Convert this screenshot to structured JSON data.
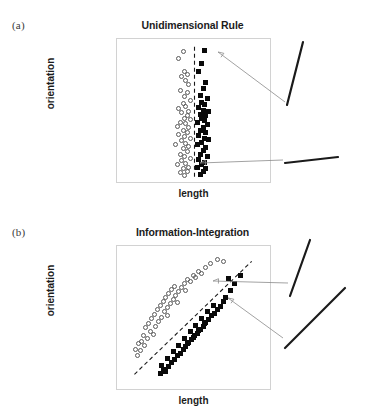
{
  "figure": {
    "background": "#ffffff",
    "open_marker_color": "#5a5a5a",
    "filled_marker_color": "#0a0a0a",
    "frame_color": "#d2d2d2",
    "bound_color": "#1a1a1a",
    "arrow_color": "#8a8a8a",
    "stimulus_color": "#1a1a1a"
  },
  "panels": [
    {
      "key": "a",
      "label": "(a)",
      "title": "Unidimensional Rule",
      "xlabel": "length",
      "ylabel": "orientation",
      "stimuli": [
        {
          "name": "steep-line-stimulus",
          "x1": 303,
          "y1": 42,
          "x2": 287,
          "y2": 105
        },
        {
          "name": "shallow-line-stimulus",
          "x1": 285,
          "y1": 163,
          "x2": 338,
          "y2": 157
        }
      ],
      "arrows": [
        {
          "name": "arrow-to-steep-stimulus",
          "x1": 285,
          "y1": 102,
          "x2": 218,
          "y2": 52
        },
        {
          "name": "arrow-to-shallow-stimulus",
          "x1": 283,
          "y1": 160,
          "x2": 200,
          "y2": 163
        }
      ]
    },
    {
      "key": "b",
      "label": "(b)",
      "title": "Information-Integration",
      "xlabel": "length",
      "ylabel": "orientation",
      "stimuli": [
        {
          "name": "steep-line-stimulus",
          "x1": 310,
          "y1": 240,
          "x2": 290,
          "y2": 296
        },
        {
          "name": "diagonal-line-stimulus",
          "x1": 285,
          "y1": 348,
          "x2": 345,
          "y2": 288
        }
      ],
      "arrows": [
        {
          "name": "arrow-to-steep-stimulus",
          "x1": 288,
          "y1": 283,
          "x2": 213,
          "y2": 281
        },
        {
          "name": "arrow-to-diagonal-stimulus",
          "x1": 283,
          "y1": 338,
          "x2": 228,
          "y2": 298
        }
      ]
    }
  ],
  "chart_data": [
    {
      "type": "scatter",
      "panel": "a",
      "title": "Unidimensional Rule",
      "xlabel": "length",
      "ylabel": "orientation",
      "xlim": [
        0,
        100
      ],
      "ylim": [
        0,
        100
      ],
      "grid": false,
      "legend": null,
      "axis_ticks": false,
      "decision_bound": {
        "name": "vertical-decision-bound",
        "style": "dashed",
        "type": "vertical",
        "x": 50,
        "y_from": 1,
        "y_to": 99
      },
      "series": [
        {
          "name": "Category A",
          "marker": "open-circle",
          "color": "#5a5a5a",
          "points": [
            [
              42,
              95
            ],
            [
              39,
              90
            ],
            [
              43,
              80
            ],
            [
              45,
              78
            ],
            [
              41,
              76
            ],
            [
              44,
              73
            ],
            [
              46,
              70
            ],
            [
              40,
              66
            ],
            [
              45,
              64
            ],
            [
              43,
              61
            ],
            [
              47,
              58
            ],
            [
              42,
              56
            ],
            [
              44,
              54
            ],
            [
              39,
              52
            ],
            [
              46,
              50
            ],
            [
              41,
              49
            ],
            [
              45,
              47
            ],
            [
              43,
              45
            ],
            [
              47,
              44
            ],
            [
              40,
              42
            ],
            [
              44,
              41
            ],
            [
              38,
              39
            ],
            [
              46,
              38
            ],
            [
              42,
              36
            ],
            [
              45,
              34
            ],
            [
              39,
              33
            ],
            [
              43,
              31
            ],
            [
              47,
              30
            ],
            [
              41,
              28
            ],
            [
              44,
              26
            ],
            [
              37,
              25
            ],
            [
              46,
              24
            ],
            [
              42,
              22
            ],
            [
              45,
              20
            ],
            [
              40,
              18
            ],
            [
              43,
              16
            ],
            [
              47,
              15
            ],
            [
              41,
              13
            ],
            [
              44,
              11
            ],
            [
              38,
              10
            ],
            [
              46,
              8
            ],
            [
              42,
              7
            ],
            [
              45,
              5
            ],
            [
              40,
              4
            ],
            [
              43,
              2
            ]
          ]
        },
        {
          "name": "Category B",
          "marker": "filled-square",
          "color": "#0a0a0a",
          "points": [
            [
              57,
              96
            ],
            [
              55,
              86
            ],
            [
              53,
              80
            ],
            [
              58,
              72
            ],
            [
              56,
              67
            ],
            [
              54,
              62
            ],
            [
              59,
              60
            ],
            [
              55,
              57
            ],
            [
              57,
              55
            ],
            [
              53,
              53
            ],
            [
              56,
              51
            ],
            [
              60,
              50
            ],
            [
              54,
              48
            ],
            [
              58,
              47
            ],
            [
              55,
              45
            ],
            [
              57,
              43
            ],
            [
              52,
              42
            ],
            [
              59,
              40
            ],
            [
              56,
              38
            ],
            [
              54,
              36
            ],
            [
              58,
              34
            ],
            [
              53,
              32
            ],
            [
              57,
              30
            ],
            [
              60,
              29
            ],
            [
              55,
              27
            ],
            [
              52,
              25
            ],
            [
              58,
              23
            ],
            [
              56,
              21
            ],
            [
              54,
              18
            ],
            [
              59,
              16
            ],
            [
              53,
              14
            ],
            [
              57,
              12
            ],
            [
              55,
              10
            ],
            [
              52,
              8
            ],
            [
              58,
              7
            ],
            [
              56,
              5
            ],
            [
              54,
              3
            ]
          ]
        }
      ]
    },
    {
      "type": "scatter",
      "panel": "b",
      "title": "Information-Integration",
      "xlabel": "length",
      "ylabel": "orientation",
      "xlim": [
        0,
        100
      ],
      "ylim": [
        0,
        100
      ],
      "grid": false,
      "legend": null,
      "axis_ticks": false,
      "decision_bound": {
        "name": "diagonal-decision-bound",
        "style": "dashed",
        "type": "diagonal",
        "x_from": 8,
        "y_from": 8,
        "x_to": 90,
        "y_to": 93
      },
      "series": [
        {
          "name": "Category A",
          "marker": "open-circle",
          "color": "#5a5a5a",
          "points": [
            [
              9,
              27
            ],
            [
              11,
              31
            ],
            [
              10,
              22
            ],
            [
              13,
              33
            ],
            [
              15,
              30
            ],
            [
              14,
              37
            ],
            [
              17,
              35
            ],
            [
              12,
              26
            ],
            [
              19,
              40
            ],
            [
              16,
              43
            ],
            [
              21,
              38
            ],
            [
              18,
              46
            ],
            [
              23,
              44
            ],
            [
              20,
              50
            ],
            [
              25,
              48
            ],
            [
              22,
              53
            ],
            [
              27,
              51
            ],
            [
              24,
              57
            ],
            [
              29,
              55
            ],
            [
              26,
              60
            ],
            [
              31,
              58
            ],
            [
              28,
              63
            ],
            [
              33,
              61
            ],
            [
              30,
              66
            ],
            [
              35,
              64
            ],
            [
              32,
              69
            ],
            [
              37,
              67
            ],
            [
              34,
              72
            ],
            [
              39,
              70
            ],
            [
              36,
              74
            ],
            [
              41,
              73
            ],
            [
              43,
              76
            ],
            [
              45,
              79
            ],
            [
              47,
              78
            ],
            [
              49,
              82
            ],
            [
              51,
              81
            ],
            [
              53,
              85
            ],
            [
              55,
              84
            ],
            [
              58,
              88
            ],
            [
              61,
              91
            ],
            [
              66,
              94
            ],
            [
              70,
              93
            ],
            [
              44,
              71
            ],
            [
              38,
              62
            ],
            [
              31,
              52
            ]
          ]
        },
        {
          "name": "Category B",
          "marker": "filled-square",
          "color": "#0a0a0a",
          "points": [
            [
              26,
              9
            ],
            [
              28,
              12
            ],
            [
              30,
              10
            ],
            [
              27,
              15
            ],
            [
              32,
              14
            ],
            [
              34,
              17
            ],
            [
              31,
              20
            ],
            [
              36,
              19
            ],
            [
              38,
              22
            ],
            [
              35,
              25
            ],
            [
              40,
              24
            ],
            [
              42,
              27
            ],
            [
              39,
              30
            ],
            [
              44,
              29
            ],
            [
              46,
              32
            ],
            [
              43,
              35
            ],
            [
              48,
              34
            ],
            [
              50,
              37
            ],
            [
              47,
              40
            ],
            [
              52,
              39
            ],
            [
              54,
              42
            ],
            [
              51,
              45
            ],
            [
              56,
              44
            ],
            [
              58,
              47
            ],
            [
              55,
              50
            ],
            [
              60,
              49
            ],
            [
              62,
              52
            ],
            [
              59,
              55
            ],
            [
              64,
              54
            ],
            [
              66,
              57
            ],
            [
              63,
              60
            ],
            [
              68,
              59
            ],
            [
              70,
              63
            ],
            [
              72,
              66
            ],
            [
              75,
              71
            ],
            [
              78,
              76
            ],
            [
              74,
              80
            ],
            [
              82,
              82
            ],
            [
              45,
              31
            ],
            [
              49,
              36
            ],
            [
              53,
              41
            ],
            [
              57,
              46
            ]
          ]
        }
      ]
    }
  ]
}
